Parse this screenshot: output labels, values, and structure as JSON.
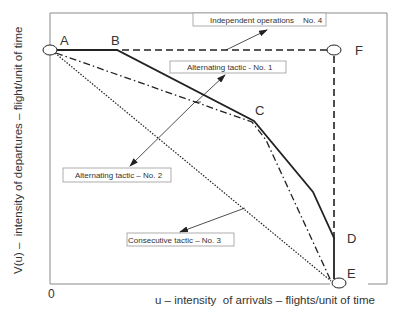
{
  "diagram": {
    "x_axis_label": "u – intensity  of arrivals – flights/unit of time",
    "y_axis_label": "V(u) –  intensity of departures – flight/unit of time",
    "origin_label": "0",
    "points": {
      "A": "A",
      "B": "B",
      "C": "C",
      "D": "D",
      "E": "E",
      "F": "F"
    },
    "callouts": [
      {
        "label": "Independent operations    No. 4",
        "line_style": "dashed",
        "path": "A-F-E"
      },
      {
        "label": "Alternating tactic - No. 1",
        "line_style": "solid",
        "path": "A-B-C-D-E"
      },
      {
        "label": "Alternating tactic – No. 2",
        "line_style": "dash-dot",
        "path": "A-C-E"
      },
      {
        "label": "Consecutive tactic – No. 3",
        "line_style": "dotted",
        "path": "A-E"
      }
    ],
    "colors": {
      "line": "#222222",
      "frame": "#8a8a8a",
      "box_border": "#9a9a9a",
      "text": "#333333"
    }
  }
}
